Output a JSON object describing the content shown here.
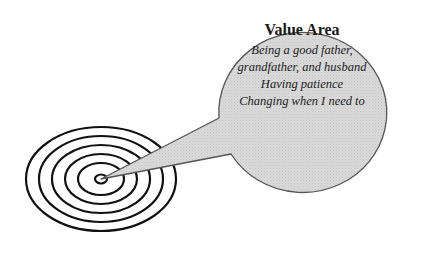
{
  "diagram": {
    "type": "target-with-speech-bubble",
    "colors": {
      "bubble_fill": "#d6d6d6",
      "bubble_stroke": "#555555",
      "ring_stroke": "#111111",
      "background": "#ffffff"
    },
    "bubble": {
      "title": "Value Area",
      "lines": [
        "Being a good father,",
        "grandfather, and husband",
        "Having patience",
        "Changing when I need to"
      ]
    },
    "target": {
      "ring_count": 6
    }
  }
}
